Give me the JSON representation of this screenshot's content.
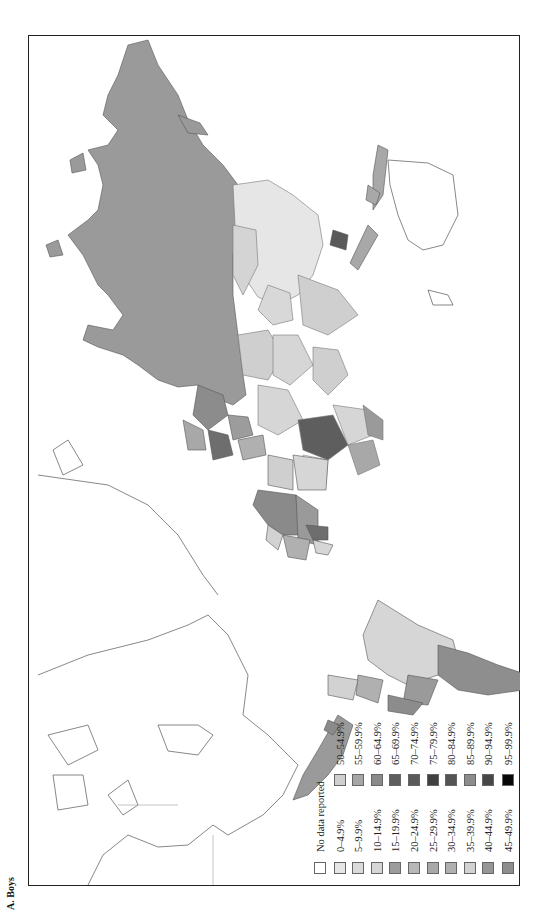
{
  "panel": {
    "label": "A. Boys"
  },
  "map": {
    "orientation": "rotated 90° counter-clockwise",
    "colors": {
      "no_data": "#ffffff",
      "outline": "#555555"
    }
  },
  "legend": {
    "title": "No data reported",
    "left_column": [
      {
        "label": "No data reported",
        "color": "#ffffff"
      },
      {
        "label": "0–4.9%",
        "color": "#e6e6e6"
      },
      {
        "label": "5–9.9%",
        "color": "#dadada"
      },
      {
        "label": "10–14.9%",
        "color": "#d6d6d6"
      },
      {
        "label": "15–19.9%",
        "color": "#9c9c9c"
      },
      {
        "label": "20–24.9%",
        "color": "#b8b8b8"
      },
      {
        "label": "25–29.9%",
        "color": "#a8a8a8"
      },
      {
        "label": "30–34.9%",
        "color": "#b0b0b0"
      },
      {
        "label": "35–39.9%",
        "color": "#d2d2d2"
      },
      {
        "label": "40–44.9%",
        "color": "#969696"
      },
      {
        "label": "45–49.9%",
        "color": "#8e8e8e"
      }
    ],
    "right_column": [
      {
        "label": "50–54.9%",
        "color": "#cfcfcf"
      },
      {
        "label": "55–59.9%",
        "color": "#a6a6a6"
      },
      {
        "label": "60–64.9%",
        "color": "#8a8a8a"
      },
      {
        "label": "65–69.9%",
        "color": "#5e5e5e"
      },
      {
        "label": "70–74.9%",
        "color": "#5a5a5a"
      },
      {
        "label": "75–79.9%",
        "color": "#404040"
      },
      {
        "label": "80–84.9%",
        "color": "#545454"
      },
      {
        "label": "85–89.9%",
        "color": "#8c8c8c"
      },
      {
        "label": "90–94.9%",
        "color": "#484848"
      },
      {
        "label": "95–99.9%",
        "color": "#080808"
      }
    ]
  }
}
